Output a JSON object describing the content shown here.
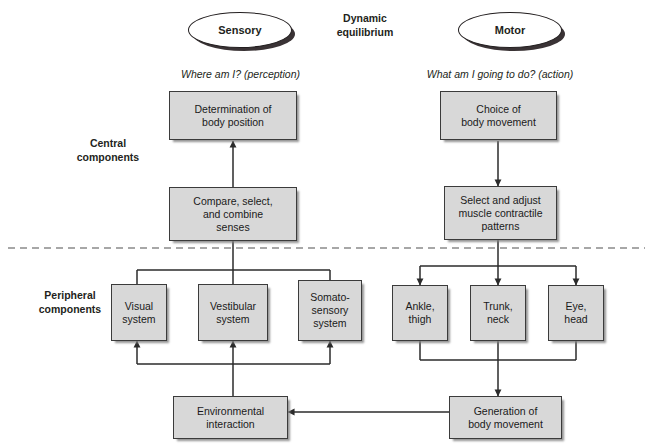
{
  "figure": {
    "title_center": "Dynamic\nequilibrium",
    "ovals": [
      {
        "name": "sensory",
        "label": "Sensory"
      },
      {
        "name": "motor",
        "label": "Motor"
      }
    ],
    "questions": {
      "sensory": "Where am I? (perception)",
      "motor": "What am I going to do? (action)"
    },
    "side_labels": {
      "central": "Central\ncomponents",
      "peripheral": "Peripheral\ncomponents"
    },
    "boxes": {
      "determination": "Determination of\nbody position",
      "compare": "Compare, select,\nand combine\nsenses",
      "choice": "Choice of\nbody movement",
      "select_adjust": "Select and adjust\nmuscle contractile\npatterns",
      "visual": "Visual\nsystem",
      "vestibular": "Vestibular\nsystem",
      "somatosensory": "Somato-\nsensory\nsystem",
      "ankle": "Ankle,\nthigh",
      "trunk": "Trunk,\nneck",
      "eye": "Eye,\nhead",
      "environmental": "Environmental\ninteraction",
      "generation": "Generation of\nbody movement"
    },
    "colors": {
      "box_fill": "#d8d8d8",
      "box_border": "#3b3b3b",
      "line": "#2b2b2b",
      "text": "#231f20",
      "divider": "#8a8a8a",
      "oval_fill": "#ffffff",
      "oval_shadow": "#3a3335"
    }
  }
}
